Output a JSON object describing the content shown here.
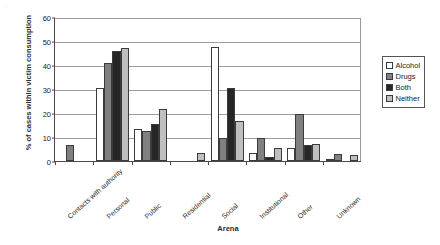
{
  "artifact_text": "::",
  "chart_data": {
    "type": "bar",
    "title": "",
    "xlabel": "Arena",
    "ylabel": "% of cases within victim consumption",
    "ylim": [
      0,
      60
    ],
    "yticks": [
      0,
      10,
      20,
      30,
      40,
      50,
      60
    ],
    "grid": true,
    "legend_position": "right",
    "categories": [
      "Contacts with authority",
      "Personal",
      "Public",
      "Residential",
      "Social",
      "Institutional",
      "Other",
      "Unknown"
    ],
    "series": [
      {
        "name": "Alcohol",
        "color": "#ffffff",
        "values": [
          0,
          30.5,
          13.5,
          0,
          47.5,
          3.5,
          5.5,
          0.5
        ]
      },
      {
        "name": "Drugs",
        "color": "#808080",
        "values": [
          6.5,
          41,
          12.5,
          0,
          9.5,
          9.5,
          19.5,
          3
        ]
      },
      {
        "name": "Both",
        "color": "#262626",
        "values": [
          0,
          46,
          15.5,
          0,
          30.5,
          1.5,
          6.5,
          0
        ]
      },
      {
        "name": "Neither",
        "color": "#bfbfbf",
        "values": [
          0,
          47,
          21.5,
          3.5,
          16.5,
          5.5,
          7,
          2.5
        ]
      }
    ]
  }
}
